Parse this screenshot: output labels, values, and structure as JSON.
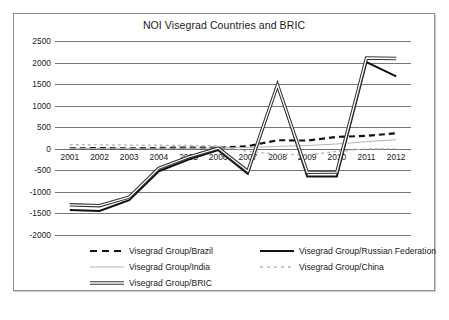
{
  "chart_data": {
    "type": "line",
    "title": "NOI Visegrad Countries and BRIC",
    "xlabel": "",
    "ylabel": "",
    "ylim": [
      -2000,
      2500
    ],
    "ytick_step": 500,
    "grid": true,
    "legend_position": "bottom",
    "categories": [
      "2001",
      "2002",
      "2003",
      "2004",
      "2005",
      "2006",
      "2007",
      "2008",
      "2009",
      "2010",
      "2011",
      "2012"
    ],
    "yticks": [
      "2500",
      "2000",
      "1500",
      "1000",
      "500",
      "0",
      "-500",
      "-1000",
      "-1500",
      "-2000"
    ],
    "series": [
      {
        "name": "Visegrad Group/Brazil",
        "style": "dashed",
        "color": "#111111",
        "width": 2.1,
        "values": [
          10,
          15,
          12,
          20,
          30,
          25,
          60,
          200,
          190,
          275,
          300,
          360
        ]
      },
      {
        "name": "Visegrad Group/Russian Federation",
        "style": "solid",
        "color": "#111111",
        "width": 2.0,
        "values": [
          -1420,
          -1440,
          -1190,
          -520,
          -250,
          -30,
          -580,
          1480,
          -645,
          -640,
          2010,
          1680
        ]
      },
      {
        "name": "Visegrad Group/India",
        "style": "solid",
        "color": "#b4b4b4",
        "width": 1.0,
        "values": [
          5,
          6,
          8,
          10,
          14,
          18,
          30,
          55,
          75,
          110,
          165,
          210
        ]
      },
      {
        "name": "Visegrad Group/China",
        "style": "dotted",
        "color": "#b9b9b9",
        "width": 1.4,
        "values": [
          95,
          90,
          85,
          80,
          75,
          70,
          -60,
          -120,
          -150,
          -60,
          0,
          0
        ]
      },
      {
        "name": "Visegrad Group/BRIC",
        "style": "triple",
        "color": "#333333",
        "width": 3.4,
        "values": [
          -1300,
          -1320,
          -1120,
          -450,
          -190,
          15,
          -520,
          1480,
          -545,
          -540,
          2105,
          2095
        ]
      }
    ]
  },
  "legend": {
    "items": [
      {
        "label": "Visegrad Group/Brazil",
        "swatch": "dashed-line-swatch"
      },
      {
        "label": "Visegrad Group/Russian Federation",
        "swatch": "solid-line-swatch"
      },
      {
        "label": "Visegrad Group/India",
        "swatch": "thin-gray-line-swatch"
      },
      {
        "label": "Visegrad Group/China",
        "swatch": "dotted-gray-line-swatch"
      },
      {
        "label": "Visegrad Group/BRIC",
        "swatch": "triple-line-swatch"
      }
    ]
  }
}
